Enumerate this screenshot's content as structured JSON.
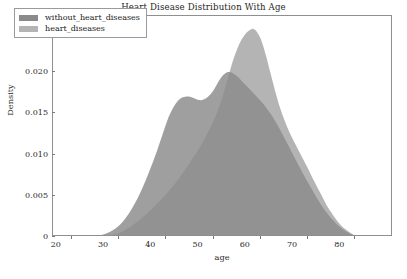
{
  "chart_data": {
    "type": "area",
    "title": "Heart Disease Distribution With Age",
    "xlabel": "age",
    "ylabel": "Density",
    "xlim": [
      16,
      88
    ],
    "ylim": [
      0,
      0.0268
    ],
    "grid": false,
    "legend_position": "upper left",
    "xticks": [
      20,
      30,
      40,
      50,
      60,
      70,
      80
    ],
    "xtick_labels": [
      "20",
      "30",
      "40",
      "50",
      "60",
      "70",
      "80"
    ],
    "yticks": [
      0,
      0.005,
      0.01,
      0.015,
      0.02,
      0.025
    ],
    "ytick_labels": [
      "0",
      "0.005",
      "0.010",
      "0.015",
      "0.020",
      "0.025"
    ],
    "colors": {
      "without_heart_diseases": "#8a8a8a",
      "heart_diseases": "#b4b4b4",
      "overlap": "#7d7d7d",
      "frame": "#8f8f8f"
    },
    "series": [
      {
        "name": "without_heart_diseases",
        "color": "#8a8a8a",
        "peak_x": 53,
        "peak_y": 0.02,
        "x": [
          24,
          26,
          28,
          30,
          32,
          34,
          36,
          38,
          40,
          41,
          42,
          43,
          44,
          45,
          46,
          47,
          48,
          49,
          50,
          51,
          52,
          53,
          54,
          55,
          56,
          57,
          58,
          59,
          60,
          61,
          62,
          63,
          64,
          65,
          66,
          67,
          68,
          69,
          70,
          71,
          72,
          73,
          74,
          75,
          76,
          77,
          78,
          79,
          80,
          81,
          82
        ],
        "y": [
          0.0,
          0.0002,
          0.0006,
          0.0014,
          0.0028,
          0.0048,
          0.0074,
          0.0104,
          0.0138,
          0.0152,
          0.0162,
          0.0168,
          0.017,
          0.017,
          0.0168,
          0.0166,
          0.0167,
          0.0171,
          0.0178,
          0.0188,
          0.0196,
          0.02,
          0.0199,
          0.0195,
          0.0189,
          0.0183,
          0.0177,
          0.0171,
          0.0165,
          0.0158,
          0.015,
          0.0141,
          0.0131,
          0.012,
          0.0109,
          0.0098,
          0.0087,
          0.0076,
          0.0066,
          0.0056,
          0.0046,
          0.0037,
          0.0029,
          0.0022,
          0.0016,
          0.0011,
          0.0007,
          0.0004,
          0.0002,
          0.0001,
          0.0
        ]
      },
      {
        "name": "heart_diseases",
        "color": "#b4b4b4",
        "peak_x": 58.5,
        "peak_y": 0.0252,
        "x": [
          26,
          28,
          30,
          32,
          34,
          36,
          38,
          40,
          42,
          44,
          45,
          46,
          47,
          48,
          49,
          50,
          51,
          52,
          53,
          54,
          55,
          56,
          57,
          58,
          58.5,
          59,
          60,
          61,
          62,
          63,
          64,
          65,
          66,
          67,
          68,
          69,
          70,
          71,
          72,
          73,
          74,
          75,
          76,
          77,
          78,
          79,
          80,
          81,
          82
        ],
        "y": [
          0.0,
          0.0002,
          0.0005,
          0.0011,
          0.0019,
          0.0029,
          0.004,
          0.0052,
          0.0066,
          0.0082,
          0.009,
          0.0099,
          0.0108,
          0.0118,
          0.0129,
          0.0141,
          0.0155,
          0.0172,
          0.0192,
          0.0212,
          0.0228,
          0.024,
          0.0248,
          0.0252,
          0.0252,
          0.025,
          0.024,
          0.0222,
          0.02,
          0.0178,
          0.0158,
          0.0142,
          0.0128,
          0.0116,
          0.0105,
          0.0094,
          0.0083,
          0.0071,
          0.006,
          0.0049,
          0.0038,
          0.0029,
          0.0021,
          0.0014,
          0.0009,
          0.0005,
          0.0002,
          0.0001,
          0.0
        ]
      }
    ]
  },
  "legend": {
    "items": [
      {
        "label": "without_heart_diseases",
        "color": "#8a8a8a"
      },
      {
        "label": "heart_diseases",
        "color": "#b4b4b4"
      }
    ]
  }
}
